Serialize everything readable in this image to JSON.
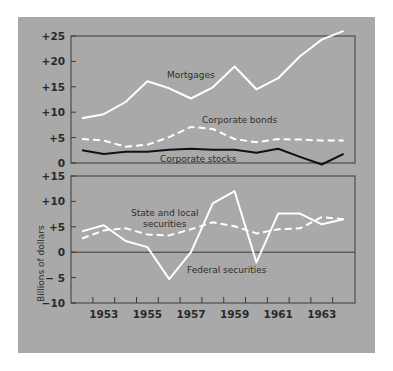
{
  "chart_data": [
    {
      "type": "line",
      "panel": "top",
      "title": "",
      "xlabel": "",
      "ylabel": "Billions of dollars",
      "x": [
        1952,
        1953,
        1954,
        1955,
        1956,
        1957,
        1958,
        1959,
        1960,
        1961,
        1962,
        1963,
        1964
      ],
      "ylim": [
        0,
        25
      ],
      "yticks": [
        0,
        5,
        10,
        15,
        20,
        25
      ],
      "ytick_labels": [
        "0",
        "+5",
        "+10",
        "+15",
        "+20",
        "+25"
      ],
      "grid": false,
      "series": [
        {
          "name": "Mortgages",
          "style": "solid",
          "color": "#ffffff",
          "values": [
            8.8,
            9.6,
            12.0,
            16.1,
            14.7,
            12.7,
            14.9,
            19.0,
            14.5,
            16.7,
            21.0,
            24.3,
            26.0
          ]
        },
        {
          "name": "Corporate bonds",
          "style": "dashed",
          "color": "#ffffff",
          "values": [
            4.7,
            4.4,
            3.2,
            3.6,
            5.1,
            7.1,
            6.7,
            4.7,
            4.1,
            4.7,
            4.6,
            4.4,
            4.4
          ]
        },
        {
          "name": "Corporate stocks",
          "style": "solid",
          "color": "#111111",
          "values": [
            2.5,
            1.8,
            2.2,
            2.2,
            2.6,
            2.8,
            2.6,
            2.6,
            2.0,
            2.8,
            1.2,
            -0.3,
            1.8
          ]
        }
      ]
    },
    {
      "type": "line",
      "panel": "bottom",
      "title": "",
      "xlabel": "",
      "ylabel": "Billions of dollars",
      "x": [
        1952,
        1953,
        1954,
        1955,
        1956,
        1957,
        1958,
        1959,
        1960,
        1961,
        1962,
        1963,
        1964
      ],
      "xtick_labels": [
        "1953",
        "1955",
        "1957",
        "1959",
        "1961",
        "1963"
      ],
      "ylim": [
        -10,
        15
      ],
      "yticks": [
        -10,
        -5,
        0,
        5,
        10,
        15
      ],
      "ytick_labels": [
        "−10",
        "− 5",
        "0",
        "+5",
        "+10",
        "+15"
      ],
      "grid": false,
      "series": [
        {
          "name": "State and local securities",
          "style": "dashed",
          "color": "#ffffff",
          "values": [
            2.7,
            4.3,
            4.7,
            3.5,
            3.3,
            4.5,
            5.9,
            5.1,
            3.7,
            4.5,
            4.7,
            6.9,
            6.5
          ]
        },
        {
          "name": "Federal securities",
          "style": "solid",
          "color": "#ffffff",
          "values": [
            4.1,
            5.3,
            2.2,
            1.0,
            -5.3,
            0.0,
            9.6,
            12.0,
            -2.0,
            7.6,
            7.6,
            5.5,
            6.5
          ]
        }
      ]
    }
  ],
  "labels": {
    "mortgages": "Mortgages",
    "corporate_bonds": "Corporate bonds",
    "corporate_stocks": "Corporate stocks",
    "state_local_line1": "State and local",
    "state_local_line2": "securities",
    "federal": "Federal securities",
    "y_axis_title": "Billions of dollars"
  },
  "colors": {
    "panel_bg": "#a9a9a9",
    "axis": "#3a3a3a",
    "white_line": "#ffffff",
    "black_line": "#111111"
  }
}
